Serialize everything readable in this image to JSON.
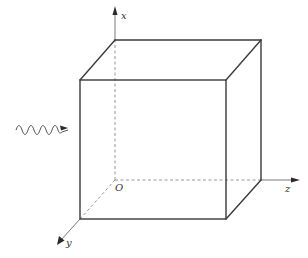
{
  "figure": {
    "axes": {
      "x": {
        "label": "x",
        "direction": "up"
      },
      "y": {
        "label": "y",
        "direction": "out-of-page (down-left)"
      },
      "z": {
        "label": "z",
        "direction": "right"
      },
      "origin": {
        "label": "O"
      }
    },
    "wave": {
      "label": "",
      "direction": "incident from left, pointing right",
      "color": "#555555"
    },
    "colors": {
      "edge": "#3a3a3a",
      "hidden_edge": "#8a8a8a",
      "background": "#ffffff"
    }
  }
}
